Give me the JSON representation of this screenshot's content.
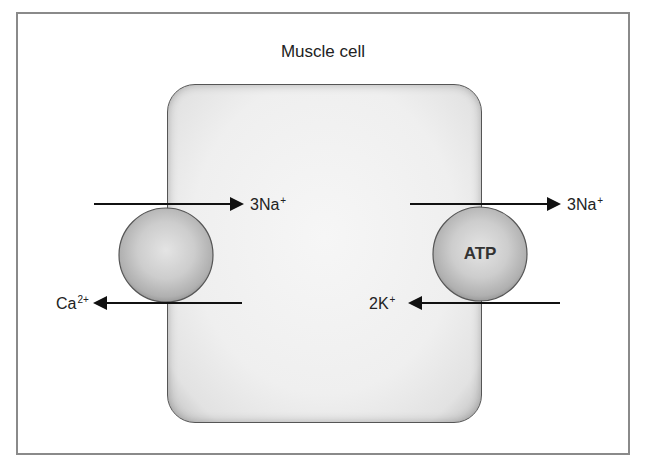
{
  "diagram": {
    "title": "Muscle cell",
    "colors": {
      "frame": "#8a8a8a",
      "cell_fill": "#efefef",
      "transporter_fill": "#cfcfcf",
      "arrow": "#111111"
    },
    "transporters": [
      {
        "name": "Na-Ca exchanger",
        "label": "",
        "position": "left membrane",
        "flows": [
          {
            "ion": "3Na",
            "charge": "+",
            "direction": "into cell"
          },
          {
            "ion": "Ca",
            "charge": "2+",
            "direction": "out of cell"
          }
        ]
      },
      {
        "name": "Na-K ATPase",
        "label": "ATP",
        "position": "right membrane",
        "flows": [
          {
            "ion": "3Na",
            "charge": "+",
            "direction": "out of cell"
          },
          {
            "ion": "2K",
            "charge": "+",
            "direction": "into cell"
          }
        ]
      }
    ],
    "labels": {
      "left_top": {
        "base": "3Na",
        "sup": "+"
      },
      "left_bottom": {
        "base": "Ca",
        "sup": "2+"
      },
      "right_top": {
        "base": "3Na",
        "sup": "+"
      },
      "right_bottom": {
        "base": "2K",
        "sup": "+"
      }
    }
  }
}
